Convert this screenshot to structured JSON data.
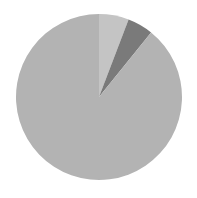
{
  "chart_data": {
    "type": "pie",
    "title": "",
    "legend": [],
    "start_angle_deg": 0,
    "direction": "clockwise",
    "center": [
      99,
      97
    ],
    "radius": 83,
    "slices": [
      {
        "label": "",
        "value": 5.8,
        "color": "#c4c4c4"
      },
      {
        "label": "",
        "value": 5.0,
        "color": "#7a7a7a"
      },
      {
        "label": "",
        "value": 89.2,
        "color": "#b3b3b3"
      }
    ]
  }
}
